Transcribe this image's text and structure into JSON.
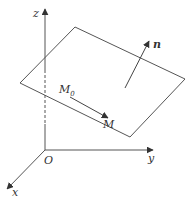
{
  "diagram": {
    "colors": {
      "stroke": "#555555",
      "text": "#333333",
      "background": "#ffffff"
    },
    "labels": {
      "z_axis": "z",
      "y_axis": "y",
      "x_axis": "x",
      "origin": "O",
      "point_m0": "M",
      "point_m0_sub": "0",
      "point_m": "M",
      "normal": "n"
    },
    "plane_corners": [
      [
        75,
        27
      ],
      [
        185,
        79
      ],
      [
        130,
        137
      ],
      [
        20,
        83
      ]
    ],
    "origin": [
      45,
      150
    ],
    "vectors": [
      {
        "name": "M0-to-M",
        "from": [
          70,
          97
        ],
        "to": [
          108,
          118
        ]
      },
      {
        "name": "normal-n",
        "from": [
          125,
          88
        ],
        "to": [
          149,
          41
        ]
      }
    ]
  }
}
